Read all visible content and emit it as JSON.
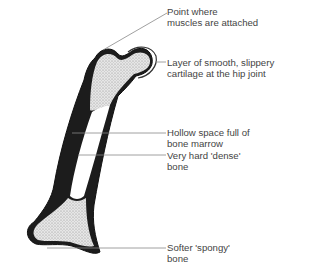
{
  "diagram": {
    "labels": [
      {
        "id": "muscle-attachment",
        "lines": [
          "Point where",
          "muscles are attached"
        ]
      },
      {
        "id": "cartilage",
        "lines": [
          "Layer of  smooth, slippery",
          "cartilage at  the hip joint"
        ]
      },
      {
        "id": "marrow-cavity",
        "lines": [
          "Hollow space full of",
          "bone marrow"
        ]
      },
      {
        "id": "dense-bone",
        "lines": [
          "Very hard 'dense'",
          "bone"
        ]
      },
      {
        "id": "spongy-bone",
        "lines": [
          "Softer 'spongy'",
          "bone"
        ]
      }
    ],
    "colors": {
      "outline": "#1a1a1a",
      "spongy_fill": "#d9d9d9",
      "leader": "#888888"
    }
  }
}
